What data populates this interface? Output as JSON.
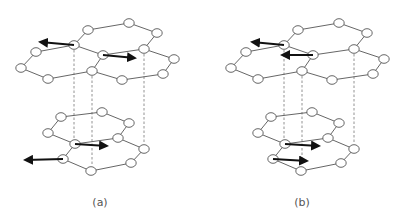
{
  "figure": {
    "panels": [
      {
        "id": "a",
        "label": "(a)",
        "label_pos": [
          100,
          208
        ],
        "offset_x": 0,
        "arrows": [
          {
            "from": [
              74,
              45
            ],
            "to": [
              40,
              42
            ]
          },
          {
            "from": [
              103,
              55
            ],
            "to": [
              135,
              58
            ]
          },
          {
            "from": [
              75,
              144
            ],
            "to": [
              107,
              146
            ]
          },
          {
            "from": [
              63,
              159
            ],
            "to": [
              25,
              160
            ]
          }
        ]
      },
      {
        "id": "b",
        "label": "(b)",
        "label_pos": [
          302,
          208
        ],
        "offset_x": 210,
        "arrows": [
          {
            "from": [
              74,
              45
            ],
            "to": [
              42,
              42
            ]
          },
          {
            "from": [
              103,
              55
            ],
            "to": [
              72,
              55
            ]
          },
          {
            "from": [
              75,
              144
            ],
            "to": [
              109,
              146
            ]
          },
          {
            "from": [
              63,
              159
            ],
            "to": [
              97,
              161
            ]
          }
        ]
      }
    ],
    "top_layer_nodes": [
      [
        88,
        30
      ],
      [
        129,
        23
      ],
      [
        157,
        33
      ],
      [
        74,
        45
      ],
      [
        144,
        49
      ],
      [
        36,
        52
      ],
      [
        103,
        55
      ],
      [
        174,
        59
      ],
      [
        21,
        68
      ],
      [
        92,
        71
      ],
      [
        163,
        74
      ],
      [
        48,
        79
      ],
      [
        122,
        80
      ]
    ],
    "top_layer_edges": [
      [
        0,
        1
      ],
      [
        1,
        2
      ],
      [
        2,
        4
      ],
      [
        0,
        3
      ],
      [
        3,
        5
      ],
      [
        5,
        8
      ],
      [
        8,
        11
      ],
      [
        11,
        9
      ],
      [
        9,
        6
      ],
      [
        6,
        3
      ],
      [
        6,
        4
      ],
      [
        4,
        7
      ],
      [
        7,
        10
      ],
      [
        10,
        12
      ],
      [
        12,
        9
      ]
    ],
    "bottom_layer_nodes": [
      [
        61,
        117
      ],
      [
        102,
        112
      ],
      [
        129,
        123
      ],
      [
        48,
        133
      ],
      [
        118,
        138
      ],
      [
        75,
        144
      ],
      [
        144,
        149
      ],
      [
        63,
        159
      ],
      [
        131,
        163
      ],
      [
        91,
        171
      ]
    ],
    "bottom_layer_edges": [
      [
        0,
        1
      ],
      [
        1,
        2
      ],
      [
        2,
        4
      ],
      [
        4,
        5
      ],
      [
        5,
        3
      ],
      [
        3,
        0
      ],
      [
        4,
        6
      ],
      [
        6,
        8
      ],
      [
        8,
        9
      ],
      [
        9,
        7
      ],
      [
        7,
        5
      ]
    ],
    "dashed_lines": [
      {
        "x": 74,
        "y1": 50,
        "y2": 139
      },
      {
        "x": 92,
        "y1": 76,
        "y2": 166
      },
      {
        "x": 144,
        "y1": 54,
        "y2": 144
      }
    ],
    "colors": {
      "node_stroke": "#555555",
      "node_fill": "#ffffff",
      "edge": "#555555",
      "arrow": "#111111",
      "dash": "#777777"
    }
  }
}
